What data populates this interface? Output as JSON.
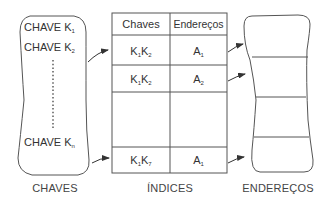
{
  "diagram": {
    "colors": {
      "stroke": "#555555",
      "text": "#333333",
      "background": "#ffffff"
    },
    "keys_box": {
      "caption": "CHAVES",
      "items": [
        {
          "text": "CHAVE K",
          "sub": "1"
        },
        {
          "text": "CHAVE K",
          "sub": "2"
        },
        {
          "text": "CHAVE K",
          "sub": "n"
        }
      ],
      "ellipsis": "dotted-vertical-line"
    },
    "index_table": {
      "caption": "ÍNDICES",
      "headers": [
        "Chaves",
        "Endereços"
      ],
      "rows": [
        {
          "key": "K",
          "key_sub1": "1",
          "key2": "K",
          "key_sub2": "2",
          "addr": "A",
          "addr_sub": "1"
        },
        {
          "key": "K",
          "key_sub1": "1",
          "key2": "K",
          "key_sub2": "2",
          "addr": "A",
          "addr_sub": "2"
        },
        {
          "key": "",
          "key_sub1": "",
          "key2": "",
          "key_sub2": "",
          "addr": "",
          "addr_sub": ""
        },
        {
          "key": "K",
          "key_sub1": "1",
          "key2": "K",
          "key_sub2": "7",
          "addr": "A",
          "addr_sub": "1"
        }
      ]
    },
    "addresses_box": {
      "caption": "ENDEREÇOS",
      "segments": 4
    },
    "arrows": [
      {
        "from": "CHAVE K2",
        "to": "index row 1"
      },
      {
        "from": "CHAVE Kn",
        "to": "index row 4"
      },
      {
        "from": "index row 1",
        "to": "address segment 1"
      },
      {
        "from": "index row 2",
        "to": "address segment 2"
      },
      {
        "from": "index row 4",
        "to": "address segment 4"
      }
    ]
  }
}
